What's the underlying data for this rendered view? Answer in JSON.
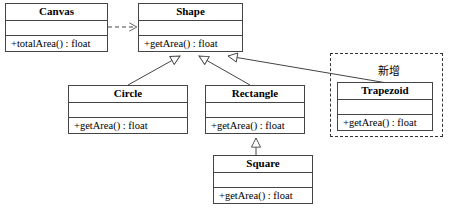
{
  "diagram": {
    "type": "uml-class-diagram",
    "background": "#ffffff",
    "line_color": "#444444",
    "classes": [
      {
        "id": "canvas",
        "name": "Canvas",
        "attributes": "",
        "operations": "+totalArea() : float",
        "x": 5,
        "y": 3,
        "width": 103,
        "height": 49
      },
      {
        "id": "shape",
        "name": "Shape",
        "attributes": "",
        "operations": "+getArea() : float",
        "x": 138,
        "y": 3,
        "width": 105,
        "height": 49
      },
      {
        "id": "circle",
        "name": "Circle",
        "attributes": "",
        "operations": "+getArea() : float",
        "x": 68,
        "y": 85,
        "width": 120,
        "height": 49
      },
      {
        "id": "rectangle",
        "name": "Rectangle",
        "attributes": "",
        "operations": "+getArea() : float",
        "x": 205,
        "y": 85,
        "width": 100,
        "height": 49
      },
      {
        "id": "trapezoid",
        "name": "Trapezoid",
        "attributes": "",
        "operations": "+getArea() : float",
        "x": 337,
        "y": 82,
        "width": 96,
        "height": 49
      },
      {
        "id": "square",
        "name": "Square",
        "attributes": "",
        "operations": "+getArea() : float",
        "x": 213,
        "y": 155,
        "width": 100,
        "height": 49
      }
    ],
    "group": {
      "id": "new-feature-group",
      "note": "新增",
      "x": 330,
      "y": 53,
      "width": 113,
      "height": 84,
      "note_x": 378,
      "note_y": 62
    },
    "relations": [
      {
        "id": "canvas-uses-shape",
        "type": "dependency",
        "from": "canvas",
        "to": "shape"
      },
      {
        "id": "circle-extends-shape",
        "type": "generalization",
        "from": "circle",
        "to": "shape"
      },
      {
        "id": "rectangle-extends-shape",
        "type": "generalization",
        "from": "rectangle",
        "to": "shape"
      },
      {
        "id": "trapezoid-extends-shape",
        "type": "generalization",
        "from": "trapezoid",
        "to": "shape"
      },
      {
        "id": "square-extends-rectangle",
        "type": "generalization",
        "from": "square",
        "to": "rectangle"
      }
    ]
  }
}
